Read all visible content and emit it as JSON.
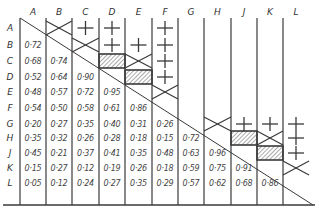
{
  "table": {
    "columns": [
      "A",
      "B",
      "C",
      "D",
      "E",
      "F",
      "G",
      "H",
      "J",
      "K",
      "L"
    ],
    "rows": [
      "A",
      "B",
      "C",
      "D",
      "E",
      "F",
      "G",
      "H",
      "J",
      "K",
      "L"
    ],
    "lower_values": [
      [],
      [
        "0·72"
      ],
      [
        "0·68",
        "0·74"
      ],
      [
        "0·52",
        "0·64",
        "0·90"
      ],
      [
        "0·48",
        "0·57",
        "0·72",
        "0·95"
      ],
      [
        "0·54",
        "0·50",
        "0·58",
        "0·61",
        "0·86"
      ],
      [
        "0·20",
        "0·27",
        "0·35",
        "0·40",
        "0·31",
        "0·26"
      ],
      [
        "0·35",
        "0·32",
        "0·26",
        "0·28",
        "0·18",
        "0·15",
        "0·72"
      ],
      [
        "0·45",
        "0·21",
        "0·37",
        "0·41",
        "0·35",
        "0·48",
        "0·63",
        "0·96"
      ],
      [
        "0·15",
        "0·27",
        "0·12",
        "0·19",
        "0·26",
        "0·18",
        "0·59",
        "0·75",
        "0·91"
      ],
      [
        "0·05",
        "0·12",
        "0·24",
        "0·27",
        "0·35",
        "0·29",
        "0·57",
        "0·62",
        "0·68",
        "0·86"
      ]
    ],
    "upper_symbols": [
      {
        "row": "A",
        "col": "B",
        "symbol": "cross-x"
      },
      {
        "row": "A",
        "col": "C",
        "symbol": "plus"
      },
      {
        "row": "A",
        "col": "D",
        "symbol": "plus"
      },
      {
        "row": "A",
        "col": "F",
        "symbol": "plus"
      },
      {
        "row": "B",
        "col": "C",
        "symbol": "cross-x"
      },
      {
        "row": "B",
        "col": "D",
        "symbol": "plus"
      },
      {
        "row": "B",
        "col": "E",
        "symbol": "plus"
      },
      {
        "row": "B",
        "col": "F",
        "symbol": "plus"
      },
      {
        "row": "C",
        "col": "D",
        "symbol": "hatched"
      },
      {
        "row": "C",
        "col": "E",
        "symbol": "cross-x"
      },
      {
        "row": "C",
        "col": "F",
        "symbol": "plus"
      },
      {
        "row": "D",
        "col": "E",
        "symbol": "hatched"
      },
      {
        "row": "D",
        "col": "F",
        "symbol": "plus"
      },
      {
        "row": "E",
        "col": "F",
        "symbol": "cross-x"
      },
      {
        "row": "G",
        "col": "H",
        "symbol": "cross-x"
      },
      {
        "row": "G",
        "col": "J",
        "symbol": "plus"
      },
      {
        "row": "G",
        "col": "K",
        "symbol": "plus"
      },
      {
        "row": "G",
        "col": "L",
        "symbol": "plus"
      },
      {
        "row": "H",
        "col": "J",
        "symbol": "hatched"
      },
      {
        "row": "H",
        "col": "K",
        "symbol": "cross-x"
      },
      {
        "row": "H",
        "col": "L",
        "symbol": "plus"
      },
      {
        "row": "J",
        "col": "K",
        "symbol": "hatched"
      },
      {
        "row": "J",
        "col": "L",
        "symbol": "plus"
      },
      {
        "row": "K",
        "col": "L",
        "symbol": "cross-x"
      }
    ]
  },
  "style": {
    "line_color": "#3a3a3a",
    "text_color": "#444444",
    "background": "#ffffff"
  }
}
